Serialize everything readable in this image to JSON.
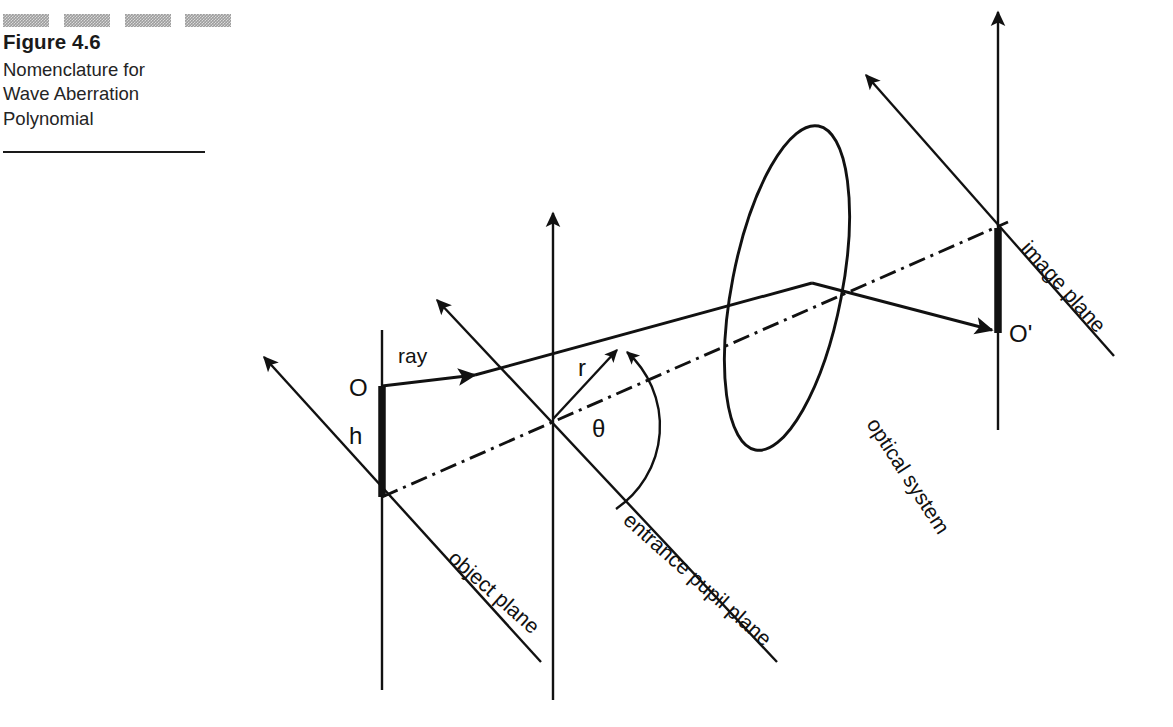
{
  "caption": {
    "figure_number": "Figure 4.6",
    "title_lines": "Nomenclature for Wave Aberration Polynomial",
    "line1": "Nomenclature for",
    "line2": "Wave Aberration",
    "line3": "Polynomial",
    "rule_block_count": 4,
    "rule_block_color": "#9d9d9d",
    "ink_color": "#1a1a1a",
    "background_color": "#ffffff"
  },
  "diagram": {
    "labels": {
      "object_plane": "object plane",
      "entrance_pupil_plane": "entrance pupil plane",
      "optical_system": "optical system",
      "image_plane": "image plane",
      "ray": "ray",
      "object_point": "O",
      "image_point": "O'",
      "object_height": "h",
      "pupil_radius": "r",
      "pupil_azimuth": "θ"
    }
  }
}
